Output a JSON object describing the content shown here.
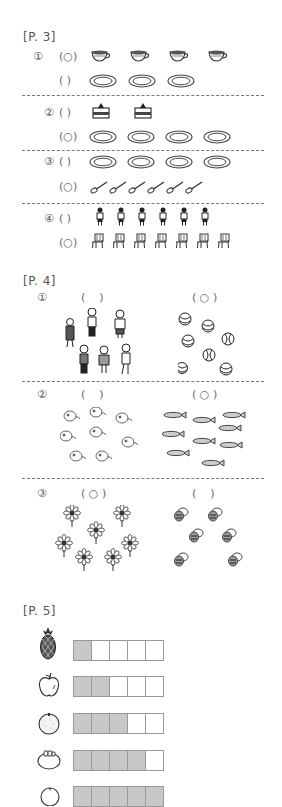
{
  "page3": {
    "header": "[P. 3]",
    "questions": [
      {
        "number": "①",
        "rows": [
          {
            "answer": "(○)",
            "item": "teacup",
            "count": 4
          },
          {
            "answer": "( )",
            "item": "saucer",
            "count": 3
          }
        ]
      },
      {
        "number": "②",
        "rows": [
          {
            "answer": "( )",
            "item": "cake",
            "count": 2
          },
          {
            "answer": "(○)",
            "item": "plate",
            "count": 4
          }
        ]
      },
      {
        "number": "③",
        "rows": [
          {
            "answer": "( )",
            "item": "plate",
            "count": 4
          },
          {
            "answer": "(○)",
            "item": "spoon",
            "count": 6
          }
        ]
      },
      {
        "number": "④",
        "rows": [
          {
            "answer": "( )",
            "item": "child",
            "count": 6
          },
          {
            "answer": "(○)",
            "item": "chair",
            "count": 7
          }
        ]
      }
    ]
  },
  "page4": {
    "header": "[P. 4]",
    "questions": [
      {
        "number": "①",
        "left": {
          "answer": "(    )",
          "item": "children",
          "count": 6
        },
        "right": {
          "answer": "( ○ )",
          "item": "balls",
          "count": 7
        }
      },
      {
        "number": "②",
        "left": {
          "answer": "(    )",
          "item": "cats",
          "count": 8
        },
        "right": {
          "answer": "( ○ )",
          "item": "fish",
          "count": 9
        }
      },
      {
        "number": "③",
        "left": {
          "answer": "( ○ )",
          "item": "flowers",
          "count": 7
        },
        "right": {
          "answer": "(    )",
          "item": "bees",
          "count": 6
        }
      }
    ]
  },
  "page5": {
    "header": "[P. 5]",
    "rows": [
      {
        "fruit": "pineapple",
        "filled": 1,
        "total": 5
      },
      {
        "fruit": "apple",
        "filled": 2,
        "total": 5
      },
      {
        "fruit": "orange",
        "filled": 3,
        "total": 5
      },
      {
        "fruit": "persimmon",
        "filled": 4,
        "total": 5
      },
      {
        "fruit": "peach",
        "filled": 5,
        "total": 5
      }
    ]
  },
  "colors": {
    "fill": "#c8c8c8",
    "line": "#999999",
    "text": "#555555"
  }
}
